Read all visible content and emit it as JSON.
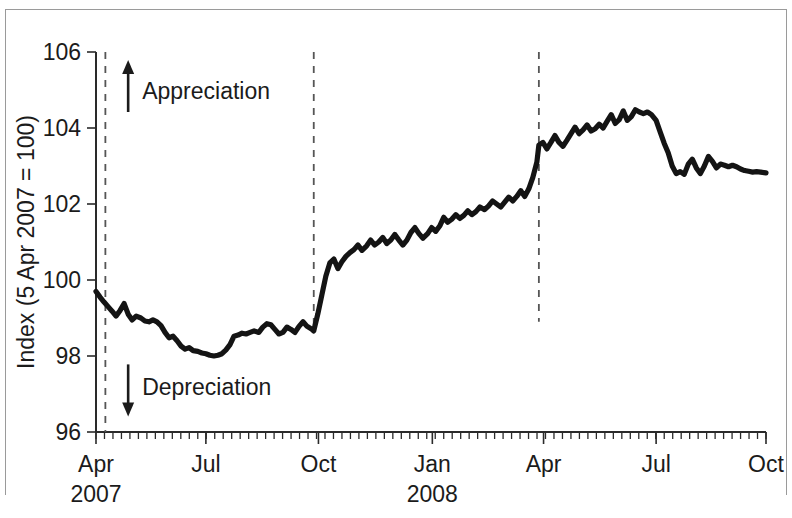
{
  "chart_data": {
    "type": "line",
    "title": "",
    "subtitle": "",
    "xlabel": "",
    "ylabel": "Index (5 Apr 2007 = 100)",
    "ylim": [
      96,
      106
    ],
    "yticks": [
      96,
      98,
      100,
      102,
      104,
      106
    ],
    "ytick_labels": [
      "96",
      "98",
      "100",
      "102",
      "104",
      "106"
    ],
    "xlim": [
      "2007-04-05",
      "2008-10-10"
    ],
    "xtick_labels": [
      "Apr",
      "Jul",
      "Oct",
      "Jan",
      "Apr",
      "Jul",
      "Oct"
    ],
    "xtick_positions": [
      0.0,
      0.164,
      0.332,
      0.502,
      0.668,
      0.836,
      1.0
    ],
    "x_year_labels": [
      {
        "label": "2007",
        "position": 0.0
      },
      {
        "label": "2008",
        "position": 0.502
      }
    ],
    "grid": false,
    "legend": null,
    "minor_ticks": "weekly",
    "line_color": "#141414",
    "event_line_color": "#555555",
    "annotations": [
      {
        "name": "appreciation",
        "label": "Appreciation",
        "arrow": "up",
        "x": 0.048,
        "y": 105.0
      },
      {
        "name": "depreciation",
        "label": "Depreciation",
        "arrow": "down",
        "x": 0.048,
        "y": 97.2
      }
    ],
    "event_lines": [
      {
        "name": "event-line-1",
        "x": 0.014,
        "y_top": 106.0,
        "y_bottom": 96.0
      },
      {
        "name": "event-line-2",
        "x": 0.325,
        "y_top": 106.0,
        "y_bottom": 98.6
      },
      {
        "name": "event-line-3",
        "x": 0.661,
        "y_top": 106.0,
        "y_bottom": 98.9
      }
    ],
    "series": [
      {
        "name": "Sterling effective exchange rate index",
        "points": [
          [
            0.0,
            99.7
          ],
          [
            0.006,
            99.55
          ],
          [
            0.012,
            99.42
          ],
          [
            0.018,
            99.3
          ],
          [
            0.024,
            99.18
          ],
          [
            0.03,
            99.05
          ],
          [
            0.036,
            99.2
          ],
          [
            0.042,
            99.38
          ],
          [
            0.048,
            99.1
          ],
          [
            0.054,
            98.95
          ],
          [
            0.06,
            99.05
          ],
          [
            0.067,
            99.0
          ],
          [
            0.073,
            98.92
          ],
          [
            0.079,
            98.9
          ],
          [
            0.085,
            98.95
          ],
          [
            0.091,
            98.9
          ],
          [
            0.097,
            98.8
          ],
          [
            0.103,
            98.62
          ],
          [
            0.109,
            98.48
          ],
          [
            0.115,
            98.52
          ],
          [
            0.121,
            98.4
          ],
          [
            0.127,
            98.26
          ],
          [
            0.133,
            98.18
          ],
          [
            0.139,
            98.22
          ],
          [
            0.145,
            98.14
          ],
          [
            0.152,
            98.12
          ],
          [
            0.158,
            98.08
          ],
          [
            0.164,
            98.06
          ],
          [
            0.17,
            98.02
          ],
          [
            0.176,
            98.0
          ],
          [
            0.182,
            98.02
          ],
          [
            0.188,
            98.06
          ],
          [
            0.194,
            98.16
          ],
          [
            0.2,
            98.3
          ],
          [
            0.206,
            98.52
          ],
          [
            0.212,
            98.55
          ],
          [
            0.218,
            98.6
          ],
          [
            0.224,
            98.58
          ],
          [
            0.23,
            98.62
          ],
          [
            0.236,
            98.66
          ],
          [
            0.243,
            98.62
          ],
          [
            0.249,
            98.76
          ],
          [
            0.255,
            98.85
          ],
          [
            0.261,
            98.82
          ],
          [
            0.267,
            98.7
          ],
          [
            0.273,
            98.58
          ],
          [
            0.279,
            98.62
          ],
          [
            0.285,
            98.76
          ],
          [
            0.291,
            98.7
          ],
          [
            0.297,
            98.62
          ],
          [
            0.303,
            98.78
          ],
          [
            0.309,
            98.9
          ],
          [
            0.315,
            98.78
          ],
          [
            0.321,
            98.72
          ],
          [
            0.325,
            98.66
          ],
          [
            0.331,
            99.1
          ],
          [
            0.337,
            99.6
          ],
          [
            0.343,
            100.1
          ],
          [
            0.349,
            100.45
          ],
          [
            0.355,
            100.55
          ],
          [
            0.361,
            100.3
          ],
          [
            0.367,
            100.48
          ],
          [
            0.373,
            100.62
          ],
          [
            0.379,
            100.72
          ],
          [
            0.385,
            100.8
          ],
          [
            0.391,
            100.92
          ],
          [
            0.397,
            100.78
          ],
          [
            0.404,
            100.9
          ],
          [
            0.41,
            101.05
          ],
          [
            0.416,
            100.92
          ],
          [
            0.422,
            101.0
          ],
          [
            0.428,
            101.12
          ],
          [
            0.434,
            100.96
          ],
          [
            0.44,
            101.05
          ],
          [
            0.446,
            101.2
          ],
          [
            0.452,
            101.05
          ],
          [
            0.458,
            100.92
          ],
          [
            0.464,
            101.05
          ],
          [
            0.47,
            101.25
          ],
          [
            0.476,
            101.38
          ],
          [
            0.482,
            101.22
          ],
          [
            0.488,
            101.1
          ],
          [
            0.495,
            101.22
          ],
          [
            0.501,
            101.38
          ],
          [
            0.507,
            101.28
          ],
          [
            0.513,
            101.42
          ],
          [
            0.519,
            101.65
          ],
          [
            0.525,
            101.52
          ],
          [
            0.531,
            101.6
          ],
          [
            0.537,
            101.72
          ],
          [
            0.543,
            101.62
          ],
          [
            0.549,
            101.7
          ],
          [
            0.555,
            101.82
          ],
          [
            0.561,
            101.72
          ],
          [
            0.567,
            101.8
          ],
          [
            0.573,
            101.92
          ],
          [
            0.58,
            101.85
          ],
          [
            0.586,
            101.95
          ],
          [
            0.592,
            102.08
          ],
          [
            0.598,
            102.0
          ],
          [
            0.604,
            101.92
          ],
          [
            0.61,
            102.05
          ],
          [
            0.616,
            102.18
          ],
          [
            0.622,
            102.08
          ],
          [
            0.628,
            102.2
          ],
          [
            0.634,
            102.35
          ],
          [
            0.64,
            102.2
          ],
          [
            0.646,
            102.4
          ],
          [
            0.652,
            102.7
          ],
          [
            0.658,
            103.1
          ],
          [
            0.661,
            103.55
          ],
          [
            0.667,
            103.62
          ],
          [
            0.673,
            103.45
          ],
          [
            0.679,
            103.62
          ],
          [
            0.685,
            103.8
          ],
          [
            0.691,
            103.62
          ],
          [
            0.697,
            103.52
          ],
          [
            0.703,
            103.68
          ],
          [
            0.709,
            103.85
          ],
          [
            0.715,
            104.02
          ],
          [
            0.721,
            103.85
          ],
          [
            0.727,
            103.95
          ],
          [
            0.733,
            104.08
          ],
          [
            0.739,
            103.92
          ],
          [
            0.745,
            103.98
          ],
          [
            0.751,
            104.1
          ],
          [
            0.757,
            104.0
          ],
          [
            0.763,
            104.18
          ],
          [
            0.769,
            104.35
          ],
          [
            0.775,
            104.12
          ],
          [
            0.781,
            104.22
          ],
          [
            0.787,
            104.45
          ],
          [
            0.793,
            104.2
          ],
          [
            0.799,
            104.3
          ],
          [
            0.805,
            104.48
          ],
          [
            0.811,
            104.42
          ],
          [
            0.817,
            104.38
          ],
          [
            0.823,
            104.42
          ],
          [
            0.829,
            104.35
          ],
          [
            0.836,
            104.2
          ],
          [
            0.842,
            103.9
          ],
          [
            0.848,
            103.6
          ],
          [
            0.854,
            103.35
          ],
          [
            0.86,
            103.0
          ],
          [
            0.866,
            102.8
          ],
          [
            0.872,
            102.85
          ],
          [
            0.878,
            102.78
          ],
          [
            0.884,
            103.05
          ],
          [
            0.89,
            103.18
          ],
          [
            0.896,
            102.95
          ],
          [
            0.902,
            102.8
          ],
          [
            0.908,
            103.0
          ],
          [
            0.914,
            103.25
          ],
          [
            0.92,
            103.12
          ],
          [
            0.926,
            102.95
          ],
          [
            0.932,
            103.05
          ],
          [
            0.938,
            103.02
          ],
          [
            0.944,
            102.98
          ],
          [
            0.95,
            103.02
          ],
          [
            0.956,
            102.98
          ],
          [
            0.962,
            102.92
          ],
          [
            0.968,
            102.88
          ],
          [
            0.974,
            102.86
          ],
          [
            0.98,
            102.84
          ],
          [
            0.986,
            102.85
          ],
          [
            0.992,
            102.84
          ],
          [
            1.0,
            102.82
          ]
        ]
      }
    ]
  },
  "figure": {
    "ylabel": "Index (5 Apr 2007 = 100)"
  }
}
